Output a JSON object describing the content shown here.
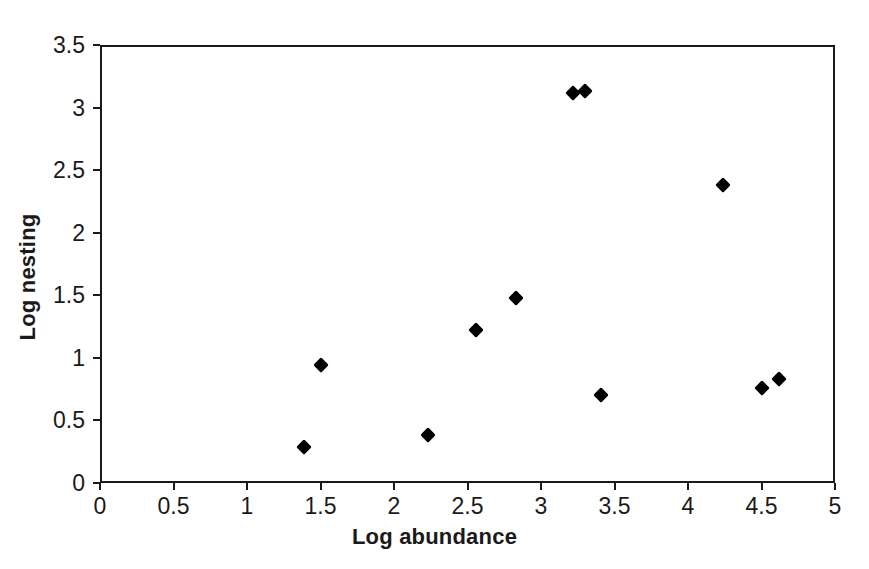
{
  "chart_data": {
    "type": "scatter",
    "title": "",
    "xlabel": "Log abundance",
    "ylabel": "Log nesting",
    "xlim": [
      0,
      5
    ],
    "ylim": [
      0,
      3.5
    ],
    "grid": false,
    "legend": null,
    "marker_style": "filled-diamond",
    "marker_color": "#000000",
    "xticks": [
      "0",
      "0.5",
      "1",
      "1.5",
      "2",
      "2.5",
      "3",
      "3.5",
      "4",
      "4.5",
      "5"
    ],
    "xtick_values": [
      0,
      0.5,
      1,
      1.5,
      2,
      2.5,
      3,
      3.5,
      4,
      4.5,
      5
    ],
    "yticks": [
      "0",
      "0.5",
      "1",
      "1.5",
      "2",
      "2.5",
      "3",
      "3.5"
    ],
    "ytick_values": [
      0,
      0.5,
      1,
      1.5,
      2,
      2.5,
      3,
      3.5
    ],
    "points": [
      {
        "x": 1.39,
        "y": 0.29
      },
      {
        "x": 1.5,
        "y": 0.94
      },
      {
        "x": 2.23,
        "y": 0.38
      },
      {
        "x": 2.56,
        "y": 1.22
      },
      {
        "x": 2.83,
        "y": 1.48
      },
      {
        "x": 3.22,
        "y": 3.12
      },
      {
        "x": 3.3,
        "y": 3.13
      },
      {
        "x": 3.41,
        "y": 0.7
      },
      {
        "x": 4.24,
        "y": 2.38
      },
      {
        "x": 4.5,
        "y": 0.76
      },
      {
        "x": 4.62,
        "y": 0.83
      }
    ]
  }
}
